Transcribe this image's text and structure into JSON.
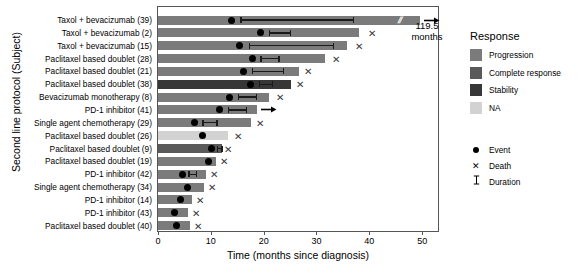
{
  "chart_data": {
    "type": "bar",
    "title": "",
    "xlabel": "Time (months since diagnosis)",
    "ylabel": "Second line protocol (Subject)",
    "xlim": [
      0,
      53
    ],
    "xticks": [
      0,
      10,
      20,
      30,
      40,
      50
    ],
    "xtick_labels": [
      "0",
      "10",
      "20",
      "30",
      "40",
      "50"
    ],
    "grid": false,
    "legend_position": "right",
    "annotation": "119.5\nmonths",
    "categories": [
      "Taxol + bevacizumab (39)",
      "Taxol + bevacizumab (2)",
      "Taxol + bevacizumab (15)",
      "Paclitaxel based doublet (28)",
      "Paclitaxel based doublet (21)",
      "Paclitaxel based doublet (38)",
      "Bevacizumab monotherapy (8)",
      "PD-1 inhibitor (41)",
      "Single agent chemotherapy (29)",
      "Paclitaxel based doublet (26)",
      "Paclitaxel based doublet (9)",
      "Paclitaxel based doublet (19)",
      "PD-1 inhibitor (42)",
      "Single agent chemotherapy (34)",
      "PD-1 inhibitor (14)",
      "PD-1 inhibitor (43)",
      "Paclitaxel based doublet (40)"
    ],
    "rows": [
      {
        "subject": "Taxol + bevacizumab (39)",
        "response": "Progression",
        "bar_end": 49.6,
        "event": 14.0,
        "duration_start": 15.6,
        "duration_end": 36.9,
        "death": null,
        "ongoing": true,
        "axis_break": true
      },
      {
        "subject": "Taxol + bevacizumab (2)",
        "response": "Progression",
        "bar_end": 38.0,
        "event": 19.4,
        "duration_start": 21.0,
        "duration_end": 24.9,
        "death": 40.6,
        "ongoing": false,
        "axis_break": false
      },
      {
        "subject": "Taxol + bevacizumab (15)",
        "response": "Progression",
        "bar_end": 35.8,
        "event": 15.4,
        "duration_start": 17.2,
        "duration_end": 33.1,
        "death": 38.0,
        "ongoing": false,
        "axis_break": false
      },
      {
        "subject": "Paclitaxel based doublet (28)",
        "response": "Progression",
        "bar_end": 31.6,
        "event": 17.8,
        "duration_start": 19.4,
        "duration_end": 22.8,
        "death": 33.7,
        "ongoing": false,
        "axis_break": false
      },
      {
        "subject": "Paclitaxel based doublet (21)",
        "response": "Progression",
        "bar_end": 26.6,
        "event": 16.1,
        "duration_start": 17.7,
        "duration_end": 23.6,
        "death": 28.4,
        "ongoing": false,
        "axis_break": false
      },
      {
        "subject": "Paclitaxel based doublet (38)",
        "response": "Stability",
        "bar_end": 25.1,
        "event": 17.5,
        "duration_start": 19.1,
        "duration_end": 21.5,
        "death": 26.9,
        "ongoing": false,
        "axis_break": false
      },
      {
        "subject": "Bevacizumab monotherapy (8)",
        "response": "Progression",
        "bar_end": 21.1,
        "event": 13.5,
        "duration_start": 15.1,
        "duration_end": 18.5,
        "death": 23.0,
        "ongoing": false,
        "axis_break": false
      },
      {
        "subject": "PD-1 inhibitor (41)",
        "response": "Progression",
        "bar_end": 18.8,
        "event": 11.6,
        "duration_start": 13.2,
        "duration_end": 16.6,
        "death": null,
        "ongoing": true,
        "axis_break": false
      },
      {
        "subject": "Single agent chemotherapy (29)",
        "response": "Progression",
        "bar_end": 17.6,
        "event": 6.9,
        "duration_start": 8.4,
        "duration_end": 11.0,
        "death": 19.3,
        "ongoing": false,
        "axis_break": false
      },
      {
        "subject": "Paclitaxel based doublet (26)",
        "response": "NA",
        "bar_end": 13.2,
        "event": 8.4,
        "duration_start": null,
        "duration_end": null,
        "death": 15.1,
        "ongoing": false,
        "axis_break": false
      },
      {
        "subject": "Paclitaxel based doublet (9)",
        "response": "Complete response",
        "bar_end": 12.1,
        "event": 10.1,
        "duration_start": 11.1,
        "duration_end": 12.0,
        "death": 13.3,
        "ongoing": false,
        "axis_break": false
      },
      {
        "subject": "Paclitaxel based doublet (19)",
        "response": "Progression",
        "bar_end": 11.0,
        "event": 9.6,
        "duration_start": null,
        "duration_end": null,
        "death": 12.5,
        "ongoing": false,
        "axis_break": false
      },
      {
        "subject": "PD-1 inhibitor (42)",
        "response": "Progression",
        "bar_end": 9.1,
        "event": 4.7,
        "duration_start": 5.7,
        "duration_end": 7.1,
        "death": 10.6,
        "ongoing": false,
        "axis_break": false
      },
      {
        "subject": "Single agent chemotherapy (34)",
        "response": "Progression",
        "bar_end": 8.8,
        "event": 5.5,
        "duration_start": null,
        "duration_end": null,
        "death": 10.3,
        "ongoing": false,
        "axis_break": false
      },
      {
        "subject": "PD-1 inhibitor (14)",
        "response": "Progression",
        "bar_end": 6.5,
        "event": 4.2,
        "duration_start": null,
        "duration_end": null,
        "death": 7.9,
        "ongoing": false,
        "axis_break": false
      },
      {
        "subject": "PD-1 inhibitor (43)",
        "response": "Progression",
        "bar_end": 5.6,
        "event": 3.1,
        "duration_start": null,
        "duration_end": null,
        "death": 7.2,
        "ongoing": false,
        "axis_break": false
      },
      {
        "subject": "Paclitaxel based doublet (40)",
        "response": "Progression",
        "bar_end": 6.1,
        "event": 3.5,
        "duration_start": null,
        "duration_end": null,
        "death": 7.5,
        "ongoing": false,
        "axis_break": false
      }
    ]
  },
  "legend": {
    "title": "Response",
    "items": [
      {
        "label": "Progression",
        "color": "#7b7b7b"
      },
      {
        "label": "Complete response",
        "color": "#5a5a5a"
      },
      {
        "label": "Stability",
        "color": "#373737"
      },
      {
        "label": "NA",
        "color": "#d2d2d2"
      }
    ],
    "markers": [
      {
        "label": "Event",
        "glyph": "dot-icon"
      },
      {
        "label": "Death",
        "glyph": "cross-icon"
      },
      {
        "label": "Duration",
        "glyph": "duration-bar-icon"
      }
    ]
  },
  "annotation": {
    "line1": "119.5",
    "line2": "months"
  }
}
